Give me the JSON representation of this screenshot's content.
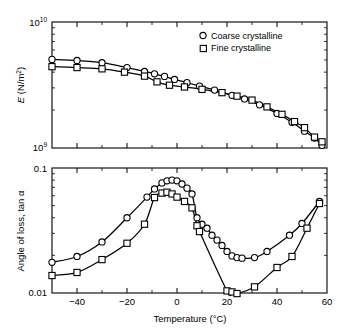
{
  "figure": {
    "background": "#ffffff",
    "ink": "#000000"
  },
  "chart_data": [
    {
      "type": "line",
      "panel": "upper",
      "title": "",
      "xlabel": "",
      "ylabel": "E (N/m²)",
      "ylabel_parts": {
        "symbol": "E",
        "units": "(N/m",
        "exp": "2",
        "close": ")"
      },
      "xlim": [
        -50,
        60
      ],
      "ylim": [
        1000000000.0,
        10000000000.0
      ],
      "yscale": "log",
      "xscale": "linear",
      "grid": false,
      "xticks_major": [
        -40,
        -20,
        0,
        20,
        40,
        60
      ],
      "xticks_minor": [
        -50,
        -30,
        -10,
        10,
        30,
        50
      ],
      "xticklabels": [
        "",
        "",
        "",
        "",
        "",
        ""
      ],
      "yticklabels": [
        "10⁹",
        "10¹⁰"
      ],
      "ytick_major_values": [
        1000000000,
        10000000000
      ],
      "legend_position": "upper right",
      "series": [
        {
          "name": "Coarse crystalline",
          "marker": "circle",
          "points": [
            {
              "x": -50,
              "y": 5050000000.0
            },
            {
              "x": -40,
              "y": 4950000000.0
            },
            {
              "x": -30,
              "y": 4750000000.0
            },
            {
              "x": -20,
              "y": 4350000000.0
            },
            {
              "x": -13,
              "y": 4050000000.0
            },
            {
              "x": -9,
              "y": 3880000000.0
            },
            {
              "x": -5,
              "y": 3700000000.0
            },
            {
              "x": -1,
              "y": 3500000000.0
            },
            {
              "x": 4,
              "y": 3300000000.0
            },
            {
              "x": 9,
              "y": 3100000000.0
            },
            {
              "x": 15,
              "y": 2880000000.0
            },
            {
              "x": 22,
              "y": 2620000000.0
            },
            {
              "x": 27,
              "y": 2450000000.0
            },
            {
              "x": 33,
              "y": 2200000000.0
            },
            {
              "x": 40,
              "y": 1880000000.0
            },
            {
              "x": 46,
              "y": 1600000000.0
            },
            {
              "x": 51,
              "y": 1360000000.0
            },
            {
              "x": 55,
              "y": 1200000000.0
            },
            {
              "x": 58,
              "y": 1050000000.0
            }
          ]
        },
        {
          "name": "Fine crystalline",
          "marker": "square",
          "points": [
            {
              "x": -50,
              "y": 4420000000.0
            },
            {
              "x": -40,
              "y": 4350000000.0
            },
            {
              "x": -30,
              "y": 4250000000.0
            },
            {
              "x": -21,
              "y": 4000000000.0
            },
            {
              "x": -13,
              "y": 3720000000.0
            },
            {
              "x": -8,
              "y": 3350000000.0
            },
            {
              "x": -3,
              "y": 3150000000.0
            },
            {
              "x": 3,
              "y": 3050000000.0
            },
            {
              "x": 10,
              "y": 2920000000.0
            },
            {
              "x": 18,
              "y": 2750000000.0
            },
            {
              "x": 24,
              "y": 2580000000.0
            },
            {
              "x": 30,
              "y": 2400000000.0
            },
            {
              "x": 36,
              "y": 2120000000.0
            },
            {
              "x": 42,
              "y": 1850000000.0
            },
            {
              "x": 47,
              "y": 1620000000.0
            },
            {
              "x": 51,
              "y": 1450000000.0
            },
            {
              "x": 55,
              "y": 1220000000.0
            },
            {
              "x": 58,
              "y": 1120000000.0
            }
          ]
        }
      ]
    },
    {
      "type": "line",
      "panel": "lower",
      "title": "",
      "xlabel": "Temperature (°C)",
      "ylabel": "Angle of loss, tan α",
      "xlim": [
        -50,
        60
      ],
      "ylim": [
        0.01,
        0.1
      ],
      "yscale": "log",
      "xscale": "linear",
      "grid": false,
      "xticks_major": [
        -40,
        -20,
        0,
        20,
        40,
        60
      ],
      "xticks_minor": [
        -50,
        -30,
        -10,
        10,
        30,
        50
      ],
      "xticklabels": [
        "−40",
        "−20",
        "0",
        "20",
        "40",
        "60"
      ],
      "yticklabels": [
        "0.01",
        "0.1"
      ],
      "ytick_major_values": [
        0.01,
        0.1
      ],
      "legend_position": "none",
      "series": [
        {
          "name": "Coarse crystalline",
          "marker": "circle",
          "points": [
            {
              "x": -50,
              "y": 0.0176
            },
            {
              "x": -40,
              "y": 0.0196
            },
            {
              "x": -30,
              "y": 0.0256
            },
            {
              "x": -20,
              "y": 0.04
            },
            {
              "x": -12,
              "y": 0.0585
            },
            {
              "x": -9,
              "y": 0.068
            },
            {
              "x": -6,
              "y": 0.076
            },
            {
              "x": -4,
              "y": 0.079
            },
            {
              "x": -2,
              "y": 0.08
            },
            {
              "x": 0,
              "y": 0.079
            },
            {
              "x": 2,
              "y": 0.0745
            },
            {
              "x": 4,
              "y": 0.069
            },
            {
              "x": 6,
              "y": 0.062
            },
            {
              "x": 8,
              "y": 0.04
            },
            {
              "x": 10,
              "y": 0.0355
            },
            {
              "x": 12,
              "y": 0.033
            },
            {
              "x": 14,
              "y": 0.029
            },
            {
              "x": 16,
              "y": 0.0265
            },
            {
              "x": 18,
              "y": 0.024
            },
            {
              "x": 20,
              "y": 0.0215
            },
            {
              "x": 22,
              "y": 0.0198
            },
            {
              "x": 24,
              "y": 0.0192
            },
            {
              "x": 26,
              "y": 0.019
            },
            {
              "x": 31,
              "y": 0.0192
            },
            {
              "x": 36,
              "y": 0.0215
            },
            {
              "x": 45,
              "y": 0.029
            },
            {
              "x": 50,
              "y": 0.036
            },
            {
              "x": 57,
              "y": 0.054
            }
          ]
        },
        {
          "name": "Fine crystalline",
          "marker": "square",
          "points": [
            {
              "x": -50,
              "y": 0.0138
            },
            {
              "x": -40,
              "y": 0.0146
            },
            {
              "x": -30,
              "y": 0.0185
            },
            {
              "x": -20,
              "y": 0.025
            },
            {
              "x": -13,
              "y": 0.0355
            },
            {
              "x": -9,
              "y": 0.058
            },
            {
              "x": -6,
              "y": 0.063
            },
            {
              "x": -4,
              "y": 0.064
            },
            {
              "x": -2,
              "y": 0.062
            },
            {
              "x": 0,
              "y": 0.0585
            },
            {
              "x": 3,
              "y": 0.054
            },
            {
              "x": 6,
              "y": 0.048
            },
            {
              "x": 8,
              "y": 0.0345
            },
            {
              "x": 9,
              "y": 0.031
            },
            {
              "x": 20,
              "y": 0.0104
            },
            {
              "x": 22,
              "y": 0.0102
            },
            {
              "x": 24,
              "y": 0.0099
            },
            {
              "x": 31,
              "y": 0.0112
            },
            {
              "x": 40,
              "y": 0.016
            },
            {
              "x": 46,
              "y": 0.0196
            },
            {
              "x": 52,
              "y": 0.033
            },
            {
              "x": 57,
              "y": 0.052
            }
          ]
        }
      ]
    }
  ],
  "legend": {
    "entries": [
      {
        "label": "Coarse crystalline",
        "marker": "circle"
      },
      {
        "label": "Fine crystalline",
        "marker": "square"
      }
    ]
  }
}
